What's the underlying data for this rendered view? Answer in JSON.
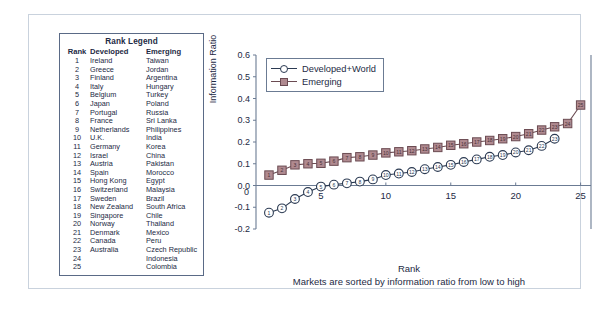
{
  "rank_legend": {
    "title": "Rank Legend",
    "columns": [
      "Rank",
      "Developed",
      "Emerging"
    ],
    "rows": [
      [
        "1",
        "Ireland",
        "Taiwan"
      ],
      [
        "2",
        "Greece",
        "Jordan"
      ],
      [
        "3",
        "Finland",
        "Argentina"
      ],
      [
        "4",
        "Italy",
        "Hungary"
      ],
      [
        "5",
        "Belgium",
        "Turkey"
      ],
      [
        "6",
        "Japan",
        "Poland"
      ],
      [
        "7",
        "Portugal",
        "Russia"
      ],
      [
        "8",
        "France",
        "Sri Lanka"
      ],
      [
        "9",
        "Netherlands",
        "Philippines"
      ],
      [
        "10",
        "U.K.",
        "India"
      ],
      [
        "11",
        "Germany",
        "Korea"
      ],
      [
        "12",
        "Israel",
        "China"
      ],
      [
        "13",
        "Austria",
        "Pakistan"
      ],
      [
        "14",
        "Spain",
        "Morocco"
      ],
      [
        "15",
        "Hong Kong",
        "Egypt"
      ],
      [
        "16",
        "Switzerland",
        "Malaysia"
      ],
      [
        "17",
        "Sweden",
        "Brazil"
      ],
      [
        "18",
        "New Zealand",
        "South Africa"
      ],
      [
        "19",
        "Singapore",
        "Chile"
      ],
      [
        "20",
        "Norway",
        "Thailand"
      ],
      [
        "21",
        "Denmark",
        "Mexico"
      ],
      [
        "22",
        "Canada",
        "Peru"
      ],
      [
        "23",
        "Australia",
        "Czech Republic"
      ],
      [
        "24",
        "",
        "Indonesia"
      ],
      [
        "25",
        "",
        "Colombia"
      ]
    ]
  },
  "chart_data": {
    "type": "line",
    "title": "",
    "xlabel": "Rank",
    "xsublabel": "Markets are sorted by information ratio from low to high",
    "ylabel": "Information Ratio",
    "xlim": [
      0,
      25.8
    ],
    "ylim": [
      -0.2,
      0.6
    ],
    "xticks": [
      5,
      10,
      15,
      20,
      25
    ],
    "yticks": [
      -0.2,
      -0.1,
      0.0,
      0.1,
      0.2,
      0.3,
      0.4,
      0.5,
      0.6
    ],
    "ytick_labels": [
      "-0.2",
      "-0.1",
      "0.0",
      "0.1",
      "0.2",
      "0.3",
      "0.4",
      "0.5",
      "0.6"
    ],
    "origin_label": "0",
    "grid": false,
    "legend_position": "top-left",
    "colors": {
      "developed_world_line": "#2b3a52",
      "developed_world_marker_fill": "#ffffff",
      "emerging_line": "#6b4b52",
      "emerging_marker_fill": "#b08a90",
      "axis": "#6b7b93",
      "frame": "#c9d2dd",
      "text": "#1d2a44"
    },
    "series": [
      {
        "name": "Developed+World",
        "marker": "open-circle",
        "x": [
          1,
          2,
          3,
          4,
          5,
          6,
          7,
          8,
          9,
          10,
          11,
          12,
          13,
          14,
          15,
          16,
          17,
          18,
          19,
          20,
          21,
          22,
          23
        ],
        "values": [
          -0.125,
          -0.105,
          -0.062,
          -0.03,
          -0.005,
          0.004,
          0.01,
          0.018,
          0.028,
          0.048,
          0.055,
          0.062,
          0.075,
          0.085,
          0.095,
          0.108,
          0.12,
          0.132,
          0.14,
          0.152,
          0.162,
          0.182,
          0.215
        ],
        "point_labels": [
          "1",
          "2",
          "3",
          "4",
          "5",
          "6",
          "7",
          "8",
          "9",
          "10",
          "11",
          "12",
          "13",
          "14",
          "15",
          "16",
          "17",
          "18",
          "19",
          "20",
          "21",
          "22",
          "23"
        ]
      },
      {
        "name": "Emerging",
        "marker": "filled-square",
        "x": [
          1,
          2,
          3,
          4,
          5,
          6,
          7,
          8,
          9,
          10,
          11,
          12,
          13,
          14,
          15,
          16,
          17,
          18,
          19,
          20,
          21,
          22,
          23,
          24,
          25
        ],
        "values": [
          0.048,
          0.07,
          0.095,
          0.1,
          0.102,
          0.112,
          0.128,
          0.132,
          0.14,
          0.15,
          0.155,
          0.16,
          0.168,
          0.175,
          0.185,
          0.192,
          0.2,
          0.207,
          0.215,
          0.225,
          0.238,
          0.255,
          0.27,
          0.285,
          0.37
        ],
        "point_labels": [
          "1",
          "2",
          "3",
          "4",
          "5",
          "6",
          "7",
          "8",
          "9",
          "10",
          "11",
          "12",
          "13",
          "14",
          "15",
          "16",
          "17",
          "18",
          "19",
          "20",
          "21",
          "22",
          "23",
          "24",
          "25"
        ]
      }
    ]
  }
}
